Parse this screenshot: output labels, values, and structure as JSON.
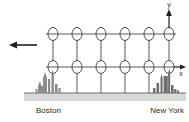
{
  "figure": {
    "background_color": "#ffffff",
    "line_color": "#4a4a4a",
    "ink_color": "#2b2b2b",
    "ground_band_color": "#d9d9d9",
    "ground_line_color": "#6b6b6b",
    "node_fill": "#ffffff"
  },
  "axes": {
    "x": {
      "label": "x",
      "direction": "right"
    },
    "y": {
      "label": "y",
      "direction": "up"
    }
  },
  "flow_arrow": {
    "label": "",
    "direction": "left"
  },
  "endpoints": {
    "left": {
      "label": "Boston"
    },
    "right": {
      "label": "New York"
    }
  },
  "lattice": {
    "columns": 6,
    "rows": 2,
    "column_x": [
      53,
      77,
      101,
      125,
      149,
      169
    ],
    "row_y": [
      34,
      67
    ],
    "node_rx": 5,
    "node_ry": 6.5
  },
  "poles": {
    "count": 6,
    "x": [
      53,
      77,
      101,
      125,
      149,
      169
    ],
    "top_y": 67,
    "bottom_y": 93
  },
  "ground": {
    "line_y": 93,
    "band_top": 93,
    "band_bottom": 101,
    "left_x": 24,
    "right_x": 186
  },
  "skylines": {
    "boston": {
      "center_x": 50,
      "base_y": 93
    },
    "new_york": {
      "center_x": 163,
      "base_y": 93
    }
  }
}
